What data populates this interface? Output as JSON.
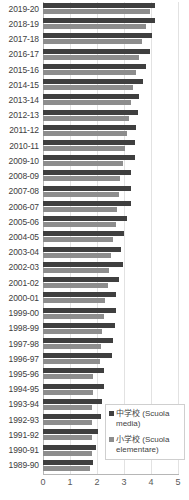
{
  "chart_data": {
    "type": "bar",
    "orientation": "horizontal",
    "title": "",
    "subtitle": "",
    "xlabel": "",
    "ylabel": "",
    "xlim": [
      0,
      5
    ],
    "xticks": [
      0,
      1,
      2,
      3,
      4,
      5
    ],
    "xtick_labels": [
      "0",
      "1",
      "2",
      "3",
      "4",
      "5"
    ],
    "grid": true,
    "grid_axis": "x",
    "legend_position": "bottom-right",
    "categories": [
      "2019-20",
      "2018-19",
      "2017-18",
      "2016-17",
      "2015-16",
      "2014-15",
      "2013-14",
      "2012-13",
      "2011-12",
      "2010-11",
      "2009-10",
      "2008-09",
      "2007-08",
      "2006-07",
      "2005-06",
      "2004-05",
      "2003-04",
      "2002-03",
      "2001-02",
      "2000-01",
      "1999-00",
      "1998-99",
      "1997-98",
      "1996-97",
      "1995-96",
      "1994-95",
      "1993-94",
      "1992-93",
      "1991-92",
      "1990-91",
      "1989-90"
    ],
    "series": [
      {
        "name": "中学校 (Scuola media)",
        "color": "#3f3f3f",
        "values": [
          4.15,
          4.15,
          4.05,
          3.95,
          3.8,
          3.7,
          3.55,
          3.5,
          3.45,
          3.4,
          3.4,
          3.25,
          3.25,
          3.25,
          3.1,
          3.0,
          2.9,
          2.95,
          2.8,
          2.7,
          2.7,
          2.65,
          2.6,
          2.55,
          2.25,
          2.25,
          2.2,
          2.15,
          2.05,
          1.95,
          1.85
        ]
      },
      {
        "name": "小学校 (Scuola elementare)",
        "color": "#8d8d8d",
        "values": [
          3.95,
          3.8,
          3.65,
          3.55,
          3.45,
          3.35,
          3.25,
          3.2,
          3.1,
          3.05,
          2.95,
          2.85,
          2.8,
          2.75,
          2.7,
          2.6,
          2.5,
          2.45,
          2.4,
          2.3,
          2.25,
          2.2,
          2.15,
          2.1,
          1.85,
          1.85,
          1.8,
          1.8,
          1.8,
          1.8,
          1.75
        ]
      }
    ]
  },
  "legend": {
    "entries": [
      {
        "label": "中学校 (Scuola media)",
        "color": "#3f3f3f"
      },
      {
        "label": "小学校 (Scuola elementare)",
        "color": "#8d8d8d"
      }
    ]
  }
}
